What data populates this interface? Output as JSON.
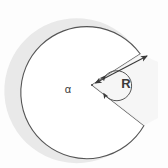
{
  "figure": {
    "type": "geometry-diagram",
    "background_color": "#fdfdfd"
  },
  "labels": {
    "angle_symbol": "α",
    "radius_symbol": "R"
  },
  "colors": {
    "outline": "#555555",
    "shadow": "#e6e6e6",
    "sector_fill": "#ffffff",
    "wedge_fill": "#f2f2f2",
    "dimension_line": "#444444",
    "text": "#3a3a3a"
  },
  "geometry": {
    "center_x": 92,
    "center_y": 85,
    "radius": 66,
    "wedge_start_angle_deg": -28,
    "wedge_end_angle_deg": 38,
    "angle_arc_radius": 15,
    "shadow_offset_x": -9,
    "shadow_offset_y": 0
  },
  "annotations": {
    "angle_label_x": 68,
    "angle_label_y": 92,
    "radius_label_x": 122,
    "radius_label_y": 86,
    "dimension_arrow": "double-headed",
    "angle_arrow": "reflex-arc-with-arrowheads"
  }
}
